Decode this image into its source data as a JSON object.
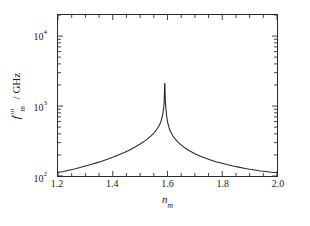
{
  "chart_data": {
    "type": "line",
    "title": "",
    "subtitle": "",
    "xlabel_text": "n",
    "xlabel_sub": "m",
    "ylabel_symbol": "f",
    "ylabel_sup": "cut",
    "ylabel_sub": "m",
    "ylabel_unit": "/ GHz",
    "xscale": "linear",
    "yscale": "log",
    "xlim": [
      1.2,
      2.0
    ],
    "ylim": [
      100,
      20000
    ],
    "xticks": [
      "1.2",
      "1.4",
      "1.6",
      "1.8",
      "2.0"
    ],
    "xtick_values": [
      1.2,
      1.4,
      1.6,
      1.8,
      2.0
    ],
    "xminor_step": 0.05,
    "yticks": [
      {
        "mantissa": "10",
        "exponent": "2",
        "value": 100
      },
      {
        "mantissa": "10",
        "exponent": "3",
        "value": 1000
      },
      {
        "mantissa": "10",
        "exponent": "4",
        "value": 10000
      }
    ],
    "grid": false,
    "legend": null,
    "legend_position": "none",
    "line_color": "#2a2a2a",
    "frame_color": "#2a2a2a",
    "background": "#ffffff",
    "annotations": [
      {
        "text": "asymptote",
        "x": 1.59,
        "note": "vertical divergence of curve"
      }
    ],
    "asymptote_x": 1.59,
    "series": [
      {
        "name": "f_m^cut",
        "x": [
          1.2,
          1.22,
          1.24,
          1.26,
          1.28,
          1.3,
          1.32,
          1.34,
          1.36,
          1.38,
          1.4,
          1.42,
          1.44,
          1.46,
          1.48,
          1.5,
          1.52,
          1.54,
          1.55,
          1.56,
          1.57,
          1.575,
          1.58,
          1.583,
          1.586,
          1.588,
          1.5895,
          1.5905,
          1.592,
          1.594,
          1.597,
          1.6,
          1.605,
          1.61,
          1.62,
          1.63,
          1.64,
          1.66,
          1.68,
          1.7,
          1.72,
          1.74,
          1.76,
          1.78,
          1.8,
          1.82,
          1.84,
          1.86,
          1.88,
          1.9,
          1.92,
          1.94,
          1.96,
          1.98,
          2.0
        ],
        "y": [
          112,
          116,
          121,
          126,
          132,
          139,
          146,
          154,
          163,
          173,
          185,
          199,
          215,
          234,
          257,
          286,
          323,
          375,
          410,
          457,
          530,
          585,
          680,
          775,
          940,
          1180,
          2100,
          2100,
          1180,
          940,
          720,
          600,
          500,
          440,
          372,
          330,
          300,
          258,
          229,
          208,
          192,
          179,
          168,
          159,
          152,
          145,
          139,
          134,
          129,
          125,
          122,
          118,
          116,
          113,
          111
        ]
      }
    ]
  }
}
